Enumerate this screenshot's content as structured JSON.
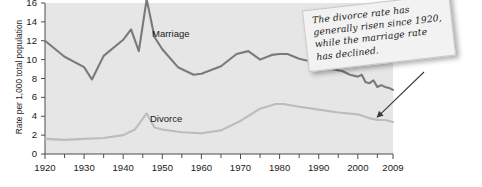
{
  "chart_data": {
    "type": "line",
    "title": "",
    "xlabel": "",
    "ylabel": "Rate per 1,000 total population",
    "xlim": [
      1920,
      2009
    ],
    "ylim": [
      0,
      16
    ],
    "ytick_values": [
      0,
      2,
      4,
      6,
      8,
      10,
      12,
      14,
      16
    ],
    "ytick_labels": [
      "0",
      "2",
      "4",
      "6",
      "8",
      "10",
      "12",
      "14",
      "16"
    ],
    "xtick_values": [
      1920,
      1930,
      1940,
      1950,
      1960,
      1970,
      1980,
      1990,
      2000,
      2009
    ],
    "xtick_labels": [
      "1920",
      "1930",
      "1940",
      "1950",
      "1960",
      "1970",
      "1980",
      "1990",
      "2000",
      "2009"
    ],
    "xminor_values": [
      1925,
      1935,
      1945,
      1955,
      1965,
      1975,
      1985,
      1995,
      2005
    ],
    "grid": false,
    "legend_position": "inline",
    "series": [
      {
        "name": "Marriage",
        "color": "#7a7a7a",
        "label_x": 1952,
        "label_y": 13.6,
        "points": [
          [
            1920,
            12.0
          ],
          [
            1925,
            10.3
          ],
          [
            1930,
            9.2
          ],
          [
            1932,
            7.9
          ],
          [
            1935,
            10.4
          ],
          [
            1940,
            12.1
          ],
          [
            1942,
            13.2
          ],
          [
            1944,
            10.9
          ],
          [
            1946,
            16.4
          ],
          [
            1948,
            12.4
          ],
          [
            1950,
            11.1
          ],
          [
            1954,
            9.2
          ],
          [
            1958,
            8.4
          ],
          [
            1960,
            8.5
          ],
          [
            1965,
            9.3
          ],
          [
            1969,
            10.6
          ],
          [
            1972,
            10.9
          ],
          [
            1975,
            10.0
          ],
          [
            1978,
            10.5
          ],
          [
            1980,
            10.6
          ],
          [
            1982,
            10.6
          ],
          [
            1985,
            10.1
          ],
          [
            1988,
            9.8
          ],
          [
            1990,
            9.8
          ],
          [
            1993,
            9.0
          ],
          [
            1996,
            8.8
          ],
          [
            1998,
            8.4
          ],
          [
            2000,
            8.2
          ],
          [
            2001,
            8.4
          ],
          [
            2002,
            7.6
          ],
          [
            2003,
            7.5
          ],
          [
            2004,
            7.8
          ],
          [
            2005,
            7.1
          ],
          [
            2006,
            7.3
          ],
          [
            2007,
            7.1
          ],
          [
            2008,
            7.0
          ],
          [
            2009,
            6.8
          ]
        ]
      },
      {
        "name": "Divorce",
        "color": "#bcbcbc",
        "label_x": 1955,
        "label_y": 4.4,
        "points": [
          [
            1920,
            1.6
          ],
          [
            1925,
            1.5
          ],
          [
            1930,
            1.6
          ],
          [
            1935,
            1.7
          ],
          [
            1940,
            2.0
          ],
          [
            1943,
            2.6
          ],
          [
            1946,
            4.3
          ],
          [
            1948,
            2.8
          ],
          [
            1950,
            2.6
          ],
          [
            1955,
            2.3
          ],
          [
            1960,
            2.2
          ],
          [
            1965,
            2.5
          ],
          [
            1970,
            3.5
          ],
          [
            1975,
            4.8
          ],
          [
            1979,
            5.3
          ],
          [
            1981,
            5.3
          ],
          [
            1985,
            5.0
          ],
          [
            1990,
            4.7
          ],
          [
            1995,
            4.4
          ],
          [
            2000,
            4.2
          ],
          [
            2003,
            3.8
          ],
          [
            2005,
            3.6
          ],
          [
            2007,
            3.6
          ],
          [
            2009,
            3.4
          ]
        ]
      }
    ],
    "annotation": {
      "text": "The divorce rate has generally risen since 1920, while the marriage rate has declined.",
      "arrow_target_year": 2005,
      "arrow_target_value": 3.6
    }
  },
  "chart": {
    "ylabel": "Rate per 1,000 total population",
    "marriage_label": "Marriage",
    "divorce_label": "Divorce",
    "callout": "The divorce rate has generally risen since 1920, while the marriage rate has declined."
  }
}
